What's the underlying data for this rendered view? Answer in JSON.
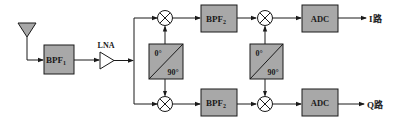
{
  "diagram": {
    "type": "block-diagram",
    "colors": {
      "box_fill": "#a8a8a8",
      "stroke": "#1a1a1a",
      "background": "#ffffff"
    },
    "antenna": {
      "label": ""
    },
    "bpf1": {
      "label": "BPF",
      "subscript": "1"
    },
    "lna": {
      "label": "LNA"
    },
    "phase_shifter_1": {
      "top": "0°",
      "bottom": "90°"
    },
    "phase_shifter_2": {
      "top": "0°",
      "bottom": "90°"
    },
    "bpf2_top": {
      "label": "BPF",
      "subscript": "2"
    },
    "bpf2_bottom": {
      "label": "BPF",
      "subscript": "2"
    },
    "adc_top": {
      "label": "ADC"
    },
    "adc_bottom": {
      "label": "ADC"
    },
    "outputs": {
      "i": "I路",
      "q": "Q路"
    }
  }
}
